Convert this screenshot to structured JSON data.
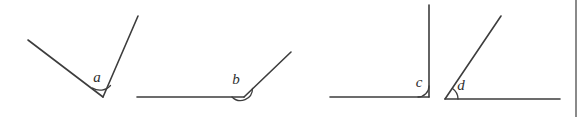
{
  "figure": {
    "background_color": "#ffffff",
    "line_color": "#3d3d3d",
    "label_color": "#2e2e2e",
    "border_color": "#8a8a8a",
    "width": 583,
    "height": 117
  },
  "angles": [
    {
      "id": "a",
      "label": "a",
      "label_x": 97,
      "label_y": 82,
      "vertex": {
        "x": 103,
        "y": 97
      },
      "ray1_end": {
        "x": 28,
        "y": 40
      },
      "ray2_end": {
        "x": 138,
        "y": 16
      },
      "arc_path": "M 92.5 88.0 A 14 14 0 0 0 110.5 85.5",
      "type": "acute"
    },
    {
      "id": "b",
      "label": "b",
      "label_x": 236,
      "label_y": 84,
      "vertex": {
        "x": 244,
        "y": 97
      },
      "ray1_end": {
        "x": 137,
        "y": 97
      },
      "ray2_end": {
        "x": 291,
        "y": 52
      },
      "arc_path": "M 232 97 A 12 12 0 0 0 252.5 88.5",
      "type": "obtuse-ish"
    },
    {
      "id": "c",
      "label": "c",
      "label_x": 419,
      "label_y": 87,
      "vertex": {
        "x": 429,
        "y": 97
      },
      "ray1_end": {
        "x": 330,
        "y": 97
      },
      "ray2_end": {
        "x": 429,
        "y": 5
      },
      "arc_path": "M 418 97 A 11 11 0 0 0 429 86",
      "type": "right"
    },
    {
      "id": "d",
      "label": "d",
      "label_x": 461,
      "label_y": 90,
      "vertex": {
        "x": 445,
        "y": 99
      },
      "ray1_end": {
        "x": 501,
        "y": 16
      },
      "ray2_end": {
        "x": 560,
        "y": 99
      },
      "arc_path": "M 452.5 88.5 A 13 13 0 0 1 458 99",
      "type": "acute"
    }
  ],
  "right_border": {
    "x": 576,
    "y1": 0,
    "y2": 117
  }
}
